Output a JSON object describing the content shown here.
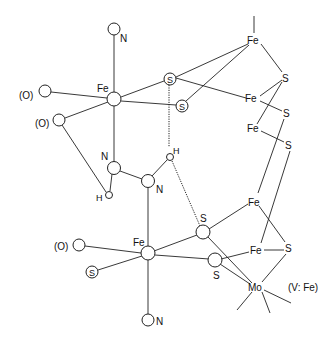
{
  "diagram": {
    "type": "chemical-structure",
    "labels": {
      "fe_upper": "Fe",
      "n_top": "N",
      "o_left1": "(O)",
      "o_left2": "(O)",
      "s_circ1": "S",
      "s_circ2": "S",
      "n_mid1": "N",
      "n_mid2": "N",
      "h1": "H",
      "h2": "H",
      "fe_lower": "Fe",
      "o_lower": "(O)",
      "s_circ3": "S",
      "n_bottom": "N",
      "s_lower1": "S",
      "s_lower2": "S",
      "cluster_fe1": "Fe",
      "cluster_s1": "S",
      "cluster_fe2": "Fe",
      "cluster_s2": "S",
      "cluster_fe3": "Fe",
      "cluster_s3": "S",
      "cluster_fe4": "Fe",
      "cluster_fe5": "Fe",
      "cluster_s4": "S",
      "mo": "Mo",
      "variant_note": "(V: Fe)"
    },
    "colors": {
      "line": "#222222",
      "background": "#ffffff"
    }
  }
}
